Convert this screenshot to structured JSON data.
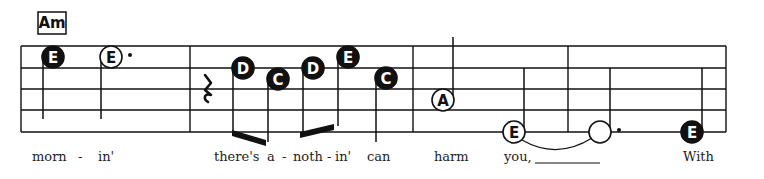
{
  "colors": {
    "ink": "#111111",
    "paper": "#ffffff",
    "lyric": "#222222"
  },
  "chord": {
    "label": "Am",
    "x": 38,
    "y": 12,
    "w": 28,
    "h": 22
  },
  "staff": {
    "left": 21,
    "right": 726,
    "lines_y": [
      46,
      68,
      89,
      110,
      132
    ],
    "barlines_x": [
      21,
      190,
      413,
      568,
      726
    ]
  },
  "notes": [
    {
      "letter": "E",
      "x": 53,
      "y": 57,
      "filled": true,
      "stem": "down",
      "stem_end": 119,
      "dot": false
    },
    {
      "letter": "E",
      "x": 111,
      "y": 57,
      "filled": false,
      "stem": "down",
      "stem_end": 119,
      "dot": true
    },
    {
      "letter": "D",
      "x": 243,
      "y": 68,
      "filled": true,
      "stem": "down",
      "stem_end": 134,
      "dot": false
    },
    {
      "letter": "C",
      "x": 278,
      "y": 79,
      "filled": true,
      "stem": "down",
      "stem_end": 142,
      "dot": false
    },
    {
      "letter": "D",
      "x": 313,
      "y": 68,
      "filled": true,
      "stem": "down",
      "stem_end": 134,
      "dot": false
    },
    {
      "letter": "E",
      "x": 348,
      "y": 57,
      "filled": true,
      "stem": "down",
      "stem_end": 126,
      "dot": false
    },
    {
      "letter": "C",
      "x": 386,
      "y": 78,
      "filled": true,
      "stem": "down",
      "stem_end": 142,
      "dot": false
    },
    {
      "letter": "A",
      "x": 443,
      "y": 100,
      "filled": false,
      "stem": "up",
      "stem_end": 37,
      "dot": false
    },
    {
      "letter": "E",
      "x": 514,
      "y": 132,
      "filled": false,
      "stem": "up",
      "stem_end": 68,
      "dot": false
    },
    {
      "letter": "",
      "x": 600,
      "y": 132,
      "filled": false,
      "stem": "up",
      "stem_end": 68,
      "dot": true
    },
    {
      "letter": "E",
      "x": 692,
      "y": 132,
      "filled": true,
      "stem": "up",
      "stem_end": 68,
      "dot": false
    }
  ],
  "rest": {
    "type": "quarter-rest",
    "x": 207,
    "y": 89
  },
  "beams": [
    {
      "x1": 232,
      "y1": 130,
      "x2": 266,
      "y2": 140
    },
    {
      "x1": 300,
      "y1": 132,
      "x2": 334,
      "y2": 124
    }
  ],
  "tie": {
    "x1": 522,
    "y1": 146,
    "x2": 592,
    "y2": 146
  },
  "extender": {
    "x1": 535,
    "x2": 600,
    "y": 163
  },
  "lyrics": [
    {
      "text": "morn",
      "x": 32
    },
    {
      "text": "-",
      "x": 78
    },
    {
      "text": "in'",
      "x": 98
    },
    {
      "text": "there's",
      "x": 214
    },
    {
      "text": "a",
      "x": 267
    },
    {
      "text": "-",
      "x": 282
    },
    {
      "text": "noth",
      "x": 293
    },
    {
      "text": "-",
      "x": 327
    },
    {
      "text": "in'",
      "x": 335
    },
    {
      "text": "can",
      "x": 367
    },
    {
      "text": "harm",
      "x": 434
    },
    {
      "text": "you,",
      "x": 504
    },
    {
      "text": "With",
      "x": 683
    }
  ],
  "lyrics_y": 161
}
